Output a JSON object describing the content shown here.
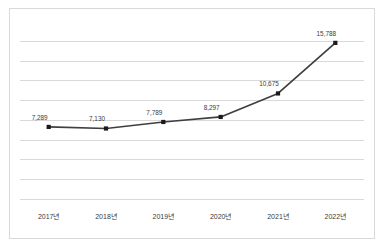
{
  "chart_data": {
    "type": "line",
    "title": "",
    "subtitle": "",
    "xlabel": "",
    "ylabel": "",
    "categories": [
      "2017년",
      "2018년",
      "2019년",
      "2020년",
      "2021년",
      "2022년"
    ],
    "values": [
      7289,
      7130,
      7789,
      8297,
      10675,
      15788
    ],
    "data_labels": [
      "7,289",
      "7,130",
      "7,789",
      "8,297",
      "10,675",
      "15,788"
    ],
    "ylim": [
      0,
      18000
    ],
    "y_gridline_values": [
      2000,
      4000,
      6000,
      8000,
      10000,
      12000,
      14000,
      16000
    ],
    "y_tick_labels_visible": false,
    "grid": true,
    "legend": false,
    "legend_position": "none",
    "series": [
      {
        "name": "series-1",
        "values": [
          7289,
          7130,
          7789,
          8297,
          10675,
          15788
        ],
        "line_color": "#3f3f3f",
        "marker_color": "#1a1a1a",
        "marker_shape": "square"
      }
    ],
    "colors": {
      "background": "#ffffff",
      "frame_border": "#d9d9d9",
      "gridline": "#d9d9d9",
      "line": "#3f3f3f",
      "marker": "#1a1a1a",
      "label_text": "#3a3a3a"
    }
  }
}
